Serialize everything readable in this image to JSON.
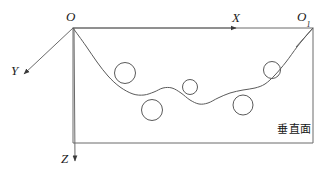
{
  "figure": {
    "type": "technical-diagram",
    "background_color": "#ffffff",
    "line_color": "#4a4a4a",
    "curve_color": "#555555",
    "text_color": "#1b1b1b"
  },
  "labels": {
    "origin": "O",
    "origin_secondary": "O",
    "origin_secondary_sub": "1",
    "axis_x": "X",
    "axis_y": "Y",
    "axis_z": "Z",
    "plane_note": "垂直面"
  },
  "chart_data": {
    "type": "line",
    "title": "",
    "xlabel": "X",
    "ylabel": "Z",
    "zlabel": "Y",
    "grid": false,
    "legend": null,
    "annotations": [
      "O",
      "O1",
      "X",
      "Y",
      "Z",
      "垂直面"
    ],
    "frame": {
      "left": 73,
      "right": 313,
      "top": 28,
      "bottom": 143
    },
    "axes": [
      {
        "name": "X",
        "from": [
          73,
          28
        ],
        "to": [
          313,
          28
        ],
        "arrow_at": [
          236,
          28
        ],
        "label_at": [
          237,
          17
        ]
      },
      {
        "name": "Y",
        "from": [
          73,
          28
        ],
        "to": [
          22,
          76
        ],
        "arrow_at": [
          22,
          76
        ],
        "label_at": [
          15,
          70
        ]
      },
      {
        "name": "Z",
        "from": [
          73,
          28
        ],
        "to": [
          75,
          165
        ],
        "arrow_at": [
          75,
          165
        ],
        "label_at": [
          66,
          158
        ]
      }
    ],
    "curve": {
      "name": "profile-curve",
      "points": [
        [
          73,
          28
        ],
        [
          86,
          46
        ],
        [
          97,
          62
        ],
        [
          108,
          76
        ],
        [
          120,
          87
        ],
        [
          133,
          94
        ],
        [
          144,
          95
        ],
        [
          154,
          92
        ],
        [
          163,
          88
        ],
        [
          172,
          88
        ],
        [
          181,
          93
        ],
        [
          190,
          100
        ],
        [
          199,
          104
        ],
        [
          208,
          103
        ],
        [
          218,
          98
        ],
        [
          230,
          93
        ],
        [
          243,
          90
        ],
        [
          255,
          88
        ],
        [
          265,
          84
        ],
        [
          275,
          75
        ],
        [
          286,
          62
        ],
        [
          297,
          47
        ],
        [
          306,
          36
        ],
        [
          313,
          28
        ]
      ]
    },
    "circles": [
      {
        "id": "inclusion-1",
        "cx": 125,
        "cy": 73,
        "r": 10.5
      },
      {
        "id": "inclusion-2",
        "cx": 152,
        "cy": 110,
        "r": 10.5
      },
      {
        "id": "inclusion-3",
        "cx": 190,
        "cy": 87,
        "r": 7.5
      },
      {
        "id": "inclusion-4",
        "cx": 243,
        "cy": 105,
        "r": 10.0
      },
      {
        "id": "inclusion-5",
        "cx": 272,
        "cy": 70,
        "r": 8.5
      }
    ]
  }
}
